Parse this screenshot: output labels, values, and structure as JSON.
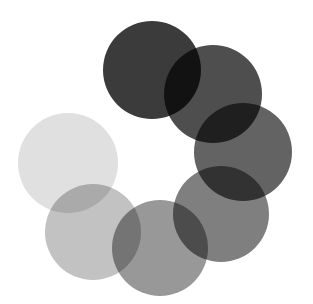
{
  "graphic": {
    "name": "seven-circle-ring-spinner",
    "description": "Seven overlapping flat circles arranged in an open ring, shaded from near-black at top clockwise through mid grays to very light gray at left, rendered with multiply blending so intersections darken.",
    "canvas": {
      "width": 313,
      "height": 304,
      "background_color": "#ffffff"
    },
    "blend_mode": "multiply",
    "circles": [
      {
        "id": "circle-1",
        "position_label": "top",
        "order": 1,
        "cx": 152,
        "cy": 70,
        "r": 49,
        "color": "#3b3b3b"
      },
      {
        "id": "circle-2",
        "position_label": "upper-right",
        "order": 2,
        "cx": 213,
        "cy": 94,
        "r": 49,
        "color": "#4e4e4e"
      },
      {
        "id": "circle-3",
        "position_label": "right",
        "order": 3,
        "cx": 243,
        "cy": 152,
        "r": 49,
        "color": "#636363"
      },
      {
        "id": "circle-4",
        "position_label": "lower-right",
        "order": 4,
        "cx": 221,
        "cy": 214,
        "r": 48,
        "color": "#7f7f7f"
      },
      {
        "id": "circle-5",
        "position_label": "bottom-center",
        "order": 5,
        "cx": 160,
        "cy": 248,
        "r": 48,
        "color": "#989898"
      },
      {
        "id": "circle-6",
        "position_label": "lower-left",
        "order": 6,
        "cx": 93,
        "cy": 232,
        "r": 48,
        "color": "#c2c2c2"
      },
      {
        "id": "circle-7",
        "position_label": "left",
        "order": 7,
        "cx": 68,
        "cy": 163,
        "r": 50,
        "color": "#e0e0e0"
      }
    ]
  }
}
